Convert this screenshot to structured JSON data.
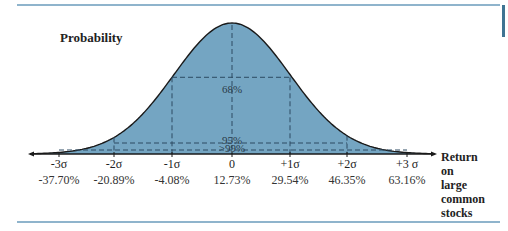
{
  "chart_data": {
    "type": "area",
    "title": "",
    "ylabel": "Probability",
    "xlabel": "Return on large common stocks",
    "xlabel_lines": [
      "Return",
      "on",
      "large",
      "common",
      "stocks"
    ],
    "distribution": "normal",
    "mean_pct": 12.73,
    "std_dev_pct": 16.81,
    "ticks": [
      {
        "sigma": "-3σ",
        "value": "-37.70%"
      },
      {
        "sigma": "-2σ",
        "value": "-20.89%"
      },
      {
        "sigma": "-1σ",
        "value": "-4.08%"
      },
      {
        "sigma": "0",
        "value": "12.73%"
      },
      {
        "sigma": "+1σ",
        "value": "29.54%"
      },
      {
        "sigma": "+2σ",
        "value": "46.35%"
      },
      {
        "sigma": "+3 σ",
        "value": "63.16%"
      }
    ],
    "x": [
      -37.7,
      -20.89,
      -4.08,
      12.73,
      29.54,
      46.35,
      63.16
    ],
    "intervals": [
      {
        "label": "68%",
        "from_sigma": -1,
        "to_sigma": 1
      },
      {
        "label": "95%",
        "from_sigma": -2,
        "to_sigma": 2
      },
      {
        "label": ">99%",
        "from_sigma": -3,
        "to_sigma": 3
      }
    ],
    "grid": false,
    "legend": "none",
    "fill_color": "#74a5c2",
    "line_color": "#1a1a1a",
    "dash_color": "#2c4a62"
  },
  "colors": {
    "rule": "#8fb4cc",
    "accent_bar": "#3f7493"
  }
}
